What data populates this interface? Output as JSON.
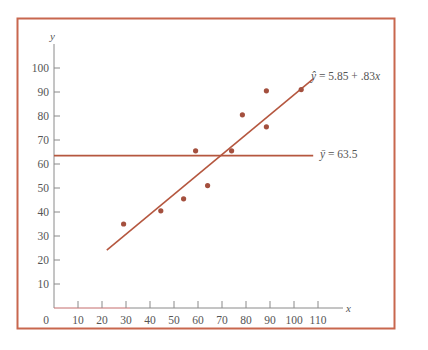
{
  "chart_data": {
    "type": "scatter",
    "title": "",
    "xlabel": "x",
    "ylabel": "y",
    "xlim": [
      0,
      115
    ],
    "ylim": [
      0,
      108
    ],
    "grid": false,
    "x_ticks": [
      0,
      10,
      20,
      30,
      40,
      50,
      60,
      70,
      80,
      90,
      100,
      110
    ],
    "y_ticks": [
      10,
      20,
      30,
      40,
      50,
      60,
      70,
      80,
      90,
      100
    ],
    "series": [
      {
        "name": "observations",
        "type": "scatter",
        "points": [
          {
            "x": 29,
            "y": 35
          },
          {
            "x": 44.5,
            "y": 40.5
          },
          {
            "x": 54,
            "y": 45.5
          },
          {
            "x": 59,
            "y": 65.5
          },
          {
            "x": 64,
            "y": 51
          },
          {
            "x": 74,
            "y": 65.5
          },
          {
            "x": 78.5,
            "y": 80.5
          },
          {
            "x": 88.5,
            "y": 75.5
          },
          {
            "x": 88.5,
            "y": 90.5
          },
          {
            "x": 103,
            "y": 91
          }
        ]
      },
      {
        "name": "regression line",
        "type": "line",
        "equation": "ŷ = 5.85 + .83x",
        "intercept": 5.85,
        "slope": 0.83,
        "x_range": [
          22,
          108
        ]
      },
      {
        "name": "mean line",
        "type": "line",
        "equation": "ȳ = 63.5",
        "y": 63.5,
        "x_range": [
          0,
          108
        ]
      }
    ],
    "annotations": [
      {
        "text": "ŷ = 5.85 + .83x",
        "near": "end of regression line"
      },
      {
        "text": "ȳ = 63.5",
        "near": "end of mean line"
      }
    ]
  },
  "labels": {
    "y_axis_title": "y",
    "x_axis_title": "x",
    "regression_label_lhs": "ŷ",
    "regression_label_rhs": " = 5.85 + .83",
    "regression_label_var": "x",
    "mean_label_lhs": "ȳ",
    "mean_label_rhs": " = 63.5",
    "x_tick_labels": [
      "0",
      "10",
      "20",
      "30",
      "40",
      "50",
      "60",
      "70",
      "80",
      "90",
      "100",
      "110"
    ],
    "y_tick_labels": [
      "10",
      "20",
      "30",
      "40",
      "50",
      "60",
      "70",
      "80",
      "90",
      "100"
    ]
  },
  "colors": {
    "frame": "#c8674e",
    "line": "#b5573f",
    "point": "#a4503e",
    "axis": "#8a8a8a",
    "text": "#555555"
  }
}
